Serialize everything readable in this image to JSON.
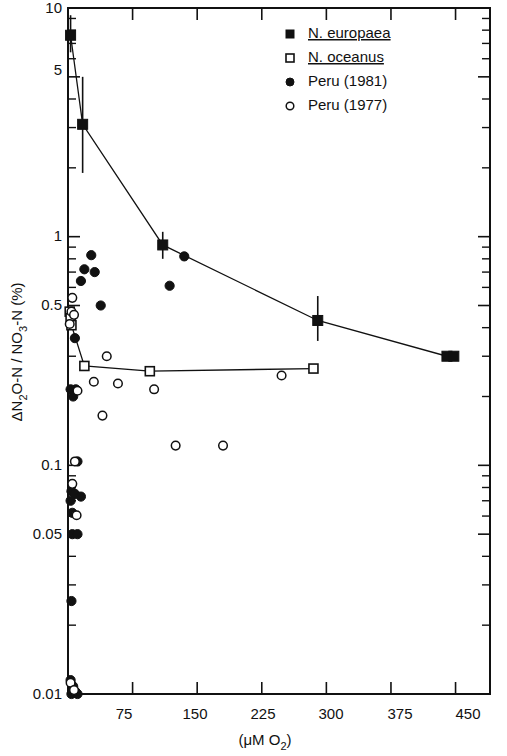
{
  "chart_data": {
    "type": "scatter",
    "title": "",
    "xlabel": "(μM O₂)",
    "ylabel": "ΔN₂O-N / NO₃-N (%)",
    "xlim": [
      0,
      490
    ],
    "ylim": [
      0.01,
      10
    ],
    "yscale": "log",
    "xscale": "linear",
    "grid": false,
    "legend_position": "top-right",
    "xticks": [
      75,
      150,
      225,
      300,
      375,
      450
    ],
    "xtick_labels": [
      "75",
      "150",
      "225",
      "300",
      "375",
      "450"
    ],
    "yticks": [
      10,
      5,
      1,
      0.5,
      0.1,
      0.05,
      0.01
    ],
    "ytick_labels": [
      "10",
      "5",
      "1",
      "0.5",
      "0.1",
      "0.05",
      "0.01"
    ],
    "series": [
      {
        "name": "N. europaea",
        "marker": "filled-square",
        "italic_genus": true,
        "connected": true,
        "has_error_bars": true,
        "points": [
          {
            "x": 3,
            "y": 7.6,
            "yerr_low": 6.4,
            "yerr_high": 9.3
          },
          {
            "x": 17,
            "y": 3.1,
            "yerr_low": 1.9,
            "yerr_high": 5.0
          },
          {
            "x": 110,
            "y": 0.92,
            "yerr_low": 0.8,
            "yerr_high": 1.05
          },
          {
            "x": 290,
            "y": 0.43,
            "yerr_low": 0.35,
            "yerr_high": 0.55
          },
          {
            "x": 440,
            "y": 0.3,
            "yerr_low": 0.3,
            "yerr_high": 0.3
          },
          {
            "x": 448,
            "y": 0.3,
            "yerr_low": 0.3,
            "yerr_high": 0.3
          }
        ]
      },
      {
        "name": "N. oceanus",
        "marker": "open-square",
        "italic_genus": true,
        "connected": true,
        "has_error_bars": false,
        "points": [
          {
            "x": 2,
            "y": 0.47
          },
          {
            "x": 3,
            "y": 0.44
          },
          {
            "x": 4,
            "y": 0.41
          },
          {
            "x": 19,
            "y": 0.272
          },
          {
            "x": 95,
            "y": 0.258
          },
          {
            "x": 285,
            "y": 0.265
          }
        ]
      },
      {
        "name": "Peru (1981)",
        "marker": "filled-circle",
        "italic_genus": false,
        "connected": false,
        "has_error_bars": false,
        "points": [
          {
            "x": 27,
            "y": 0.83
          },
          {
            "x": 19,
            "y": 0.72
          },
          {
            "x": 31,
            "y": 0.7
          },
          {
            "x": 15,
            "y": 0.64
          },
          {
            "x": 38,
            "y": 0.5
          },
          {
            "x": 135,
            "y": 0.82
          },
          {
            "x": 118,
            "y": 0.61
          },
          {
            "x": 8,
            "y": 0.36
          },
          {
            "x": 3,
            "y": 0.215
          },
          {
            "x": 9,
            "y": 0.215
          },
          {
            "x": 6,
            "y": 0.2
          },
          {
            "x": 11,
            "y": 0.104
          },
          {
            "x": 4,
            "y": 0.077
          },
          {
            "x": 8,
            "y": 0.075
          },
          {
            "x": 15,
            "y": 0.073
          },
          {
            "x": 3,
            "y": 0.07
          },
          {
            "x": 5,
            "y": 0.062
          },
          {
            "x": 5,
            "y": 0.05
          },
          {
            "x": 11,
            "y": 0.05
          },
          {
            "x": 4,
            "y": 0.0255
          },
          {
            "x": 3,
            "y": 0.0115
          },
          {
            "x": 6,
            "y": 0.0108
          },
          {
            "x": 9,
            "y": 0.0102
          },
          {
            "x": 4,
            "y": 0.01
          },
          {
            "x": 11,
            "y": 0.01
          }
        ]
      },
      {
        "name": "Peru (1977)",
        "marker": "open-circle",
        "italic_genus": false,
        "connected": false,
        "has_error_bars": false,
        "points": [
          {
            "x": 5,
            "y": 0.54
          },
          {
            "x": 4,
            "y": 0.47
          },
          {
            "x": 7,
            "y": 0.455
          },
          {
            "x": 2,
            "y": 0.415
          },
          {
            "x": 11,
            "y": 0.212
          },
          {
            "x": 45,
            "y": 0.3
          },
          {
            "x": 30,
            "y": 0.232
          },
          {
            "x": 58,
            "y": 0.228
          },
          {
            "x": 40,
            "y": 0.165
          },
          {
            "x": 100,
            "y": 0.215
          },
          {
            "x": 125,
            "y": 0.122
          },
          {
            "x": 180,
            "y": 0.122
          },
          {
            "x": 248,
            "y": 0.247
          },
          {
            "x": 8,
            "y": 0.104
          },
          {
            "x": 5,
            "y": 0.083
          },
          {
            "x": 10,
            "y": 0.0605
          },
          {
            "x": 3,
            "y": 0.0112
          },
          {
            "x": 7,
            "y": 0.0104
          }
        ]
      }
    ]
  },
  "legend": {
    "entries": [
      {
        "marker": "filled-square",
        "genus": "N.",
        "species": "europaea",
        "label": "N. europaea",
        "underline": true
      },
      {
        "marker": "open-square",
        "genus": "N.",
        "species": "oceanus",
        "label": "N. oceanus",
        "underline": true
      },
      {
        "marker": "filled-circle",
        "genus": "",
        "species": "",
        "label": "Peru (1981)",
        "underline": false
      },
      {
        "marker": "open-circle",
        "genus": "",
        "species": "",
        "label": "Peru (1977)",
        "underline": false
      }
    ]
  },
  "axes": {
    "y_title_parts": {
      "delta": "ΔN",
      "sub1": "2",
      "mid": "O-N / NO",
      "sub2": "3",
      "tail": "-N (%)"
    },
    "x_title_parts": {
      "open": "(",
      "mu": "μM  O",
      "sub": "2",
      "close": ")"
    },
    "ytick_0": "10",
    "ytick_1": "5",
    "ytick_2": "1",
    "ytick_3": "0.5",
    "ytick_4": "0.1",
    "ytick_5": "0.05",
    "ytick_6": "0.01",
    "xtick_0": "75",
    "xtick_1": "150",
    "xtick_2": "225",
    "xtick_3": "300",
    "xtick_4": "375",
    "xtick_5": "450"
  },
  "colors": {
    "ink": "#111111",
    "paper": "#ffffff"
  }
}
